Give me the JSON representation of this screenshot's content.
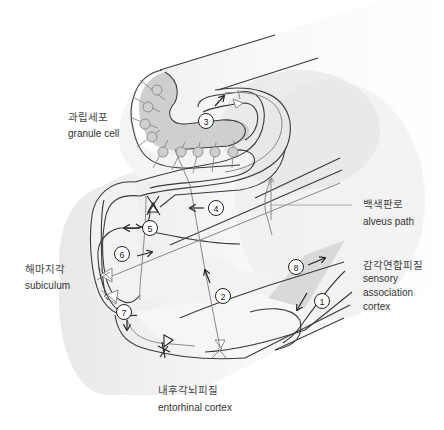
{
  "diagram": {
    "labels": {
      "granule_cell": {
        "ko": "과립세포",
        "en": "granule cell"
      },
      "alveus_path": {
        "ko": "백색판로",
        "en": "alveus path"
      },
      "subiculum": {
        "ko": "해마지각",
        "en": "subiculum"
      },
      "sensory_association_cortex": {
        "ko": "감각연합피질",
        "en_lines": [
          "sensory",
          "association",
          "cortex"
        ]
      },
      "entorhinal_cortex": {
        "ko": "내후각뇌피질",
        "en": "entorhinal cortex"
      }
    },
    "steps": [
      "1",
      "2",
      "3",
      "4",
      "5",
      "6",
      "7",
      "8"
    ],
    "colors": {
      "outline": "#3a3a3a",
      "fiber_gray": "#8a8a8a",
      "shade": "#c8c8c8",
      "cell_fill": "#cfcfcf",
      "background": "#ffffff"
    }
  }
}
